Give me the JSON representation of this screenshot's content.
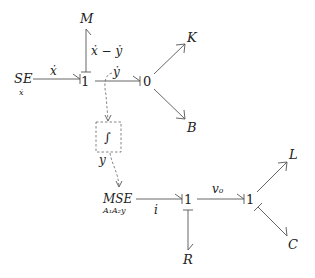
{
  "diagram": {
    "type": "bond_graph",
    "nodes": {
      "se": {
        "label": "SE",
        "sub": "ẋ"
      },
      "junction1_top": {
        "label": "1"
      },
      "m": {
        "label": "M"
      },
      "zero": {
        "label": "0"
      },
      "k": {
        "label": "K"
      },
      "b": {
        "label": "B"
      },
      "integrator": {
        "label": "∫"
      },
      "mse": {
        "label": "MSE",
        "sub": "A₁A₂y"
      },
      "junction1_mid": {
        "label": "1"
      },
      "r": {
        "label": "R"
      },
      "junction1_right": {
        "label": "1"
      },
      "l": {
        "label": "L"
      },
      "c": {
        "label": "C"
      }
    },
    "edge_labels": {
      "se_to_1": "ẋ",
      "one_to_m": "ẋ − ẏ",
      "one_to_zero": "ẏ",
      "integrator_out": "y",
      "mse_to_1": "i",
      "one_to_one": "vₒ"
    }
  }
}
